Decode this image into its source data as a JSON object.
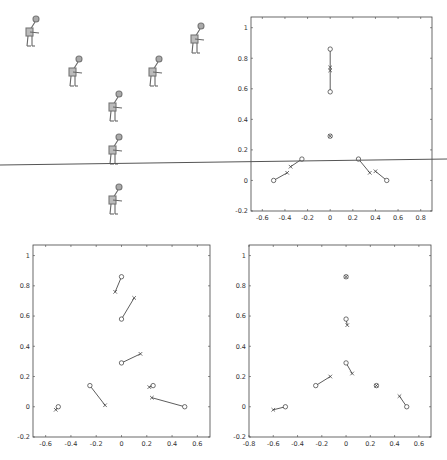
{
  "figure": {
    "panel_a": {
      "description": "Sequence of human figure poses arranged in layout",
      "figures": [
        {
          "x": 30,
          "y": 30
        },
        {
          "x": 195,
          "y": 37
        },
        {
          "x": 73,
          "y": 70
        },
        {
          "x": 153,
          "y": 70
        },
        {
          "x": 113,
          "y": 105
        },
        {
          "x": 113,
          "y": 148
        },
        {
          "x": 113,
          "y": 198
        }
      ]
    },
    "horizon_line": {
      "x1": 0,
      "y1": 165,
      "x2": 447,
      "y2": 159,
      "color": "#555555"
    }
  },
  "chart_data": [
    {
      "type": "scatter",
      "title": "",
      "xlabel": "",
      "ylabel": "",
      "xlim": [
        -0.7,
        0.9
      ],
      "ylim": [
        -0.2,
        1.07
      ],
      "xticks": [
        "-0.6",
        "-0.4",
        "-0.2",
        "0",
        "0.2",
        "0.4",
        "0.6",
        "0.8"
      ],
      "yticks": [
        "-0.2",
        "0",
        "0.2",
        "0.4",
        "0.6",
        "0.8",
        "1"
      ],
      "grid": false,
      "circles": [
        [
          0,
          0.86
        ],
        [
          0,
          0.58
        ],
        [
          0,
          0.29
        ],
        [
          -0.25,
          0.14
        ],
        [
          0.25,
          0.14
        ],
        [
          -0.5,
          0
        ],
        [
          0.5,
          0
        ]
      ],
      "crosses": [
        [
          0,
          0.74
        ],
        [
          0,
          0.72
        ],
        [
          0,
          0.29
        ],
        [
          -0.35,
          0.09
        ],
        [
          0.35,
          0.05
        ],
        [
          -0.38,
          0.05
        ],
        [
          0.4,
          0.06
        ]
      ],
      "segments": [
        [
          [
            0,
            0.86
          ],
          [
            0,
            0.58
          ]
        ],
        [
          [
            -0.25,
            0.14
          ],
          [
            -0.35,
            0.09
          ]
        ],
        [
          [
            0.25,
            0.14
          ],
          [
            0.35,
            0.05
          ]
        ],
        [
          [
            -0.5,
            0
          ],
          [
            -0.38,
            0.05
          ]
        ],
        [
          [
            0.5,
            0
          ],
          [
            0.4,
            0.06
          ]
        ]
      ]
    },
    {
      "type": "scatter",
      "title": "",
      "xlabel": "",
      "ylabel": "",
      "xlim": [
        -0.7,
        0.7
      ],
      "ylim": [
        -0.2,
        1.07
      ],
      "xticks": [
        "-0.6",
        "-0.4",
        "-0.2",
        "0",
        "0.2",
        "0.4",
        "0.6"
      ],
      "yticks": [
        "-0.2",
        "0",
        "0.2",
        "0.4",
        "0.6",
        "0.8",
        "1"
      ],
      "grid": false,
      "circles": [
        [
          0,
          0.86
        ],
        [
          0,
          0.58
        ],
        [
          0,
          0.29
        ],
        [
          -0.25,
          0.14
        ],
        [
          0.25,
          0.14
        ],
        [
          -0.5,
          0
        ],
        [
          0.5,
          0
        ]
      ],
      "crosses": [
        [
          -0.05,
          0.76
        ],
        [
          0.1,
          0.72
        ],
        [
          0.15,
          0.35
        ],
        [
          -0.13,
          0.01
        ],
        [
          0.22,
          0.13
        ],
        [
          -0.52,
          -0.02
        ],
        [
          0.24,
          0.06
        ]
      ],
      "segments": [
        [
          [
            0,
            0.86
          ],
          [
            -0.05,
            0.76
          ]
        ],
        [
          [
            0,
            0.58
          ],
          [
            0.1,
            0.72
          ]
        ],
        [
          [
            0,
            0.29
          ],
          [
            0.15,
            0.35
          ]
        ],
        [
          [
            -0.25,
            0.14
          ],
          [
            -0.13,
            0.01
          ]
        ],
        [
          [
            0.25,
            0.14
          ],
          [
            0.22,
            0.13
          ]
        ],
        [
          [
            -0.5,
            0
          ],
          [
            -0.52,
            -0.02
          ]
        ],
        [
          [
            0.5,
            0
          ],
          [
            0.24,
            0.06
          ]
        ]
      ]
    },
    {
      "type": "scatter",
      "title": "",
      "xlabel": "",
      "ylabel": "",
      "xlim": [
        -0.8,
        0.7
      ],
      "ylim": [
        -0.2,
        1.07
      ],
      "xticks": [
        "-0.8",
        "-0.6",
        "-0.4",
        "-0.2",
        "0",
        "0.2",
        "0.4",
        "0.6"
      ],
      "yticks": [
        "-0.2",
        "0",
        "0.2",
        "0.4",
        "0.6",
        "0.8",
        "1"
      ],
      "grid": false,
      "circles": [
        [
          0,
          0.86
        ],
        [
          0,
          0.58
        ],
        [
          0,
          0.29
        ],
        [
          -0.25,
          0.14
        ],
        [
          0.25,
          0.14
        ],
        [
          -0.5,
          0
        ],
        [
          0.5,
          0
        ]
      ],
      "crosses": [
        [
          0,
          0.86
        ],
        [
          0.01,
          0.54
        ],
        [
          0.05,
          0.22
        ],
        [
          -0.13,
          0.2
        ],
        [
          0.25,
          0.14
        ],
        [
          -0.6,
          -0.02
        ],
        [
          0.44,
          0.07
        ]
      ],
      "segments": [
        [
          [
            0,
            0.58
          ],
          [
            0.01,
            0.54
          ]
        ],
        [
          [
            0,
            0.29
          ],
          [
            0.05,
            0.22
          ]
        ],
        [
          [
            -0.25,
            0.14
          ],
          [
            -0.13,
            0.2
          ]
        ],
        [
          [
            -0.5,
            0
          ],
          [
            -0.6,
            -0.02
          ]
        ],
        [
          [
            0.5,
            0
          ],
          [
            0.44,
            0.07
          ]
        ]
      ]
    }
  ],
  "plots_layout": [
    {
      "left": 251,
      "right": 432,
      "top": 17,
      "bottom": 211
    },
    {
      "left": 33,
      "right": 210,
      "top": 245,
      "bottom": 437
    },
    {
      "left": 249,
      "right": 431,
      "top": 245,
      "bottom": 437
    }
  ]
}
